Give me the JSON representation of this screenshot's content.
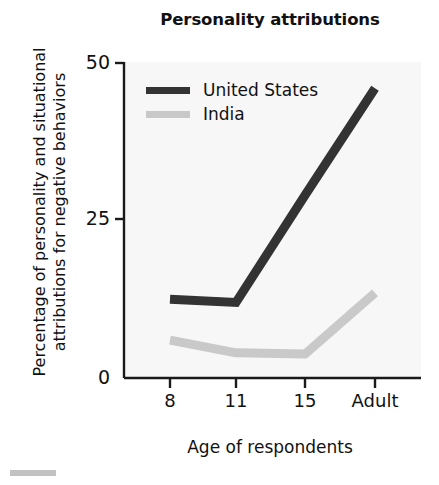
{
  "figure": {
    "title": "Personality attributions",
    "background": "#ffffff",
    "plot_background": "#f7f7f7"
  },
  "axes": {
    "y": {
      "label_line1": "Percentage of personality and situational",
      "label_line2": "attributions for negative behaviors",
      "ticks": [
        "0",
        "25",
        "50"
      ],
      "min": 0,
      "max": 50
    },
    "x": {
      "label": "Age of respondents",
      "ticks": [
        "8",
        "11",
        "15",
        "Adult"
      ]
    }
  },
  "legend": {
    "items": [
      {
        "label": "United States",
        "color": "#333333"
      },
      {
        "label": "India",
        "color": "#c9c9c9"
      }
    ]
  },
  "chart_data": {
    "type": "line",
    "title": "Personality attributions",
    "xlabel": "Age of respondents",
    "ylabel": "Percentage of personality and situational attributions for negative behaviors",
    "categories": [
      "8",
      "11",
      "15",
      "Adult"
    ],
    "ylim": [
      0,
      50
    ],
    "yticks": [
      0,
      25,
      50
    ],
    "grid": false,
    "legend_position": "top-left inside plot",
    "series": [
      {
        "name": "United States",
        "color": "#333333",
        "values": [
          12.5,
          12,
          29,
          46
        ]
      },
      {
        "name": "India",
        "color": "#c9c9c9",
        "values": [
          6,
          4,
          3.8,
          13.5
        ]
      }
    ]
  }
}
